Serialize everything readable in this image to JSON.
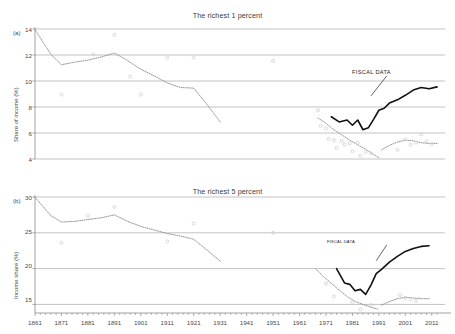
{
  "figure": {
    "background": "#ffffff",
    "axis_color": "#8a8a8a",
    "grid_color": "#9a9a9a",
    "fiscal_color": "#111111",
    "survey_color": "#8d8d8d",
    "scatter_color": "#cfcfcf"
  },
  "panels": [
    {
      "letter": "(a)",
      "title": "The richest 1 percent",
      "ylabel": "Share of income (%)",
      "annotation": "FISCAL DATA",
      "yticks": [
        "14",
        "12",
        "10",
        "8",
        "6",
        "4"
      ],
      "xticks": [
        "1861",
        "1871",
        "1881",
        "1891",
        "1901",
        "1911",
        "1921",
        "1931",
        "1941",
        "1951",
        "1961",
        "1971",
        "1981",
        "1991",
        "2001",
        "2011"
      ]
    },
    {
      "letter": "(b)",
      "title": "The richest 5 percent",
      "ylabel": "Income share (%)",
      "annotation": "FISCAL DATA",
      "yticks": [
        "30",
        "25",
        "20",
        "15"
      ],
      "xticks": [
        "1861",
        "1871",
        "1881",
        "1891",
        "1901",
        "1911",
        "1921",
        "1931",
        "1941",
        "1951",
        "1961",
        "1971",
        "1981",
        "1991",
        "2001",
        "2011"
      ]
    }
  ],
  "chart_data": [
    {
      "type": "line",
      "panel": "(a)",
      "title": "The richest 1 percent",
      "xlabel": "",
      "ylabel": "Share of income (%)",
      "xlim": [
        1861,
        2016
      ],
      "ylim": [
        4,
        14
      ],
      "ytick_values": [
        4,
        6,
        8,
        10,
        12,
        14
      ],
      "xtick_values": [
        1861,
        1871,
        1881,
        1891,
        1901,
        1911,
        1921,
        1931,
        1941,
        1951,
        1961,
        1971,
        1981,
        1991,
        2001,
        2011
      ],
      "grid": "horizontal",
      "legend": "none",
      "annotations": [
        {
          "text": "FISCAL DATA",
          "x": 1994,
          "y": 10.55,
          "points_to": {
            "x": 1988,
            "y": 8.85
          }
        }
      ],
      "series": [
        {
          "name": "Survey estimate (historical, dotted)",
          "style": "dotted",
          "color": "#8d8d8d",
          "x": [
            1861,
            1867,
            1871,
            1876,
            1881,
            1886,
            1891,
            1895,
            1901,
            1906,
            1911,
            1916,
            1921,
            1926,
            1931
          ],
          "values": [
            13.95,
            12.05,
            11.25,
            11.45,
            11.6,
            11.85,
            12.15,
            11.7,
            10.9,
            10.4,
            9.85,
            9.5,
            9.45,
            8.2,
            6.85
          ]
        },
        {
          "name": "Survey estimate (modern declining, dotted)",
          "style": "dotted",
          "color": "#8d8d8d",
          "x": [
            1968,
            1971,
            1974,
            1977,
            1980,
            1983,
            1986,
            1989,
            1991
          ],
          "values": [
            7.15,
            6.75,
            6.25,
            5.85,
            5.45,
            5.1,
            4.75,
            4.35,
            4.1
          ]
        },
        {
          "name": "Survey estimate (modern recovering, dotted)",
          "style": "dotted",
          "color": "#8d8d8d",
          "x": [
            1992,
            1995,
            1998,
            2001,
            2004,
            2007,
            2010,
            2013
          ],
          "values": [
            4.7,
            5.05,
            5.3,
            5.45,
            5.4,
            5.25,
            5.2,
            5.2
          ]
        },
        {
          "name": "FISCAL DATA",
          "style": "solid",
          "color": "#111111",
          "x": [
            1973,
            1976,
            1979,
            1981,
            1983,
            1985,
            1987,
            1989,
            1991,
            1993,
            1995,
            1998,
            2001,
            2004,
            2007,
            2010,
            2013
          ],
          "values": [
            7.25,
            6.85,
            7.0,
            6.6,
            7.0,
            6.25,
            6.4,
            7.05,
            7.75,
            7.9,
            8.3,
            8.55,
            8.9,
            9.3,
            9.5,
            9.4,
            9.55
          ]
        },
        {
          "name": "Scatter observations",
          "style": "scatter",
          "color": "#cfcfcf",
          "x": [
            1871,
            1883,
            1891,
            1897,
            1901,
            1911,
            1921,
            1951,
            1968,
            1969,
            1971,
            1972,
            1974,
            1975,
            1977,
            1978,
            1980,
            1981,
            1983,
            1984,
            1986,
            1988,
            1998,
            2001,
            2003,
            2005,
            2007,
            2009,
            2011
          ],
          "values": [
            8.95,
            12.05,
            13.55,
            10.35,
            8.95,
            11.8,
            11.8,
            11.55,
            7.75,
            6.55,
            6.35,
            5.55,
            5.45,
            4.85,
            5.4,
            5.1,
            5.2,
            4.6,
            5.25,
            4.25,
            4.55,
            4.45,
            4.7,
            5.5,
            5.1,
            5.25,
            5.9,
            5.35,
            5.15
          ]
        }
      ]
    },
    {
      "type": "line",
      "panel": "(b)",
      "title": "The richest 5 percent",
      "xlabel": "",
      "ylabel": "Income share (%)",
      "xlim": [
        1861,
        2016
      ],
      "ylim": [
        13.8,
        30
      ],
      "ytick_values": [
        15,
        20,
        25,
        30
      ],
      "xtick_values": [
        1861,
        1871,
        1881,
        1891,
        1901,
        1911,
        1921,
        1931,
        1941,
        1951,
        1961,
        1971,
        1981,
        1991,
        2001,
        2011
      ],
      "grid": "horizontal",
      "legend": "none",
      "annotations": [
        {
          "text": "FISCAL DATA",
          "x": 1994,
          "y": 23.6,
          "points_to": {
            "x": 1990,
            "y": 21.1
          }
        }
      ],
      "series": [
        {
          "name": "Survey estimate (historical, dotted)",
          "style": "dotted",
          "color": "#8d8d8d",
          "x": [
            1861,
            1867,
            1871,
            1876,
            1881,
            1886,
            1891,
            1896,
            1901,
            1906,
            1911,
            1916,
            1921,
            1926,
            1931
          ],
          "values": [
            29.95,
            27.4,
            26.5,
            26.6,
            26.85,
            27.1,
            27.5,
            26.6,
            25.9,
            25.4,
            24.9,
            24.55,
            24.1,
            22.6,
            21.05
          ]
        },
        {
          "name": "Survey estimate (modern declining, dotted)",
          "style": "dotted",
          "color": "#8d8d8d",
          "x": [
            1967,
            1970,
            1973,
            1976,
            1979,
            1982,
            1985,
            1988,
            1991
          ],
          "values": [
            20.0,
            18.9,
            17.95,
            17.0,
            16.1,
            15.4,
            15.0,
            14.6,
            14.3
          ]
        },
        {
          "name": "Survey estimate (modern recovering, dotted)",
          "style": "dotted",
          "color": "#8d8d8d",
          "x": [
            1992,
            1995,
            1998,
            2001,
            2004,
            2007,
            2010
          ],
          "values": [
            14.9,
            15.4,
            15.8,
            16.0,
            15.9,
            15.8,
            15.8
          ]
        },
        {
          "name": "FISCAL DATA",
          "style": "solid",
          "color": "#111111",
          "x": [
            1975,
            1978,
            1980,
            1982,
            1984,
            1986,
            1988,
            1990,
            1992,
            1995,
            1998,
            2001,
            2004,
            2007,
            2010
          ],
          "values": [
            20.0,
            18.0,
            17.8,
            16.9,
            17.1,
            16.4,
            17.7,
            19.3,
            19.9,
            20.9,
            21.7,
            22.4,
            22.8,
            23.1,
            23.2
          ]
        },
        {
          "name": "Scatter observations",
          "style": "scatter",
          "color": "#cfcfcf",
          "x": [
            1871,
            1881,
            1891,
            1911,
            1921,
            1951,
            1971,
            1974,
            1981,
            1984,
            1988,
            1999,
            2001,
            2003,
            2005
          ],
          "values": [
            23.6,
            27.4,
            28.6,
            23.8,
            26.3,
            25.0,
            17.9,
            16.1,
            15.3,
            14.3,
            14.9,
            16.3,
            15.9,
            15.7,
            15.5
          ]
        }
      ]
    }
  ]
}
